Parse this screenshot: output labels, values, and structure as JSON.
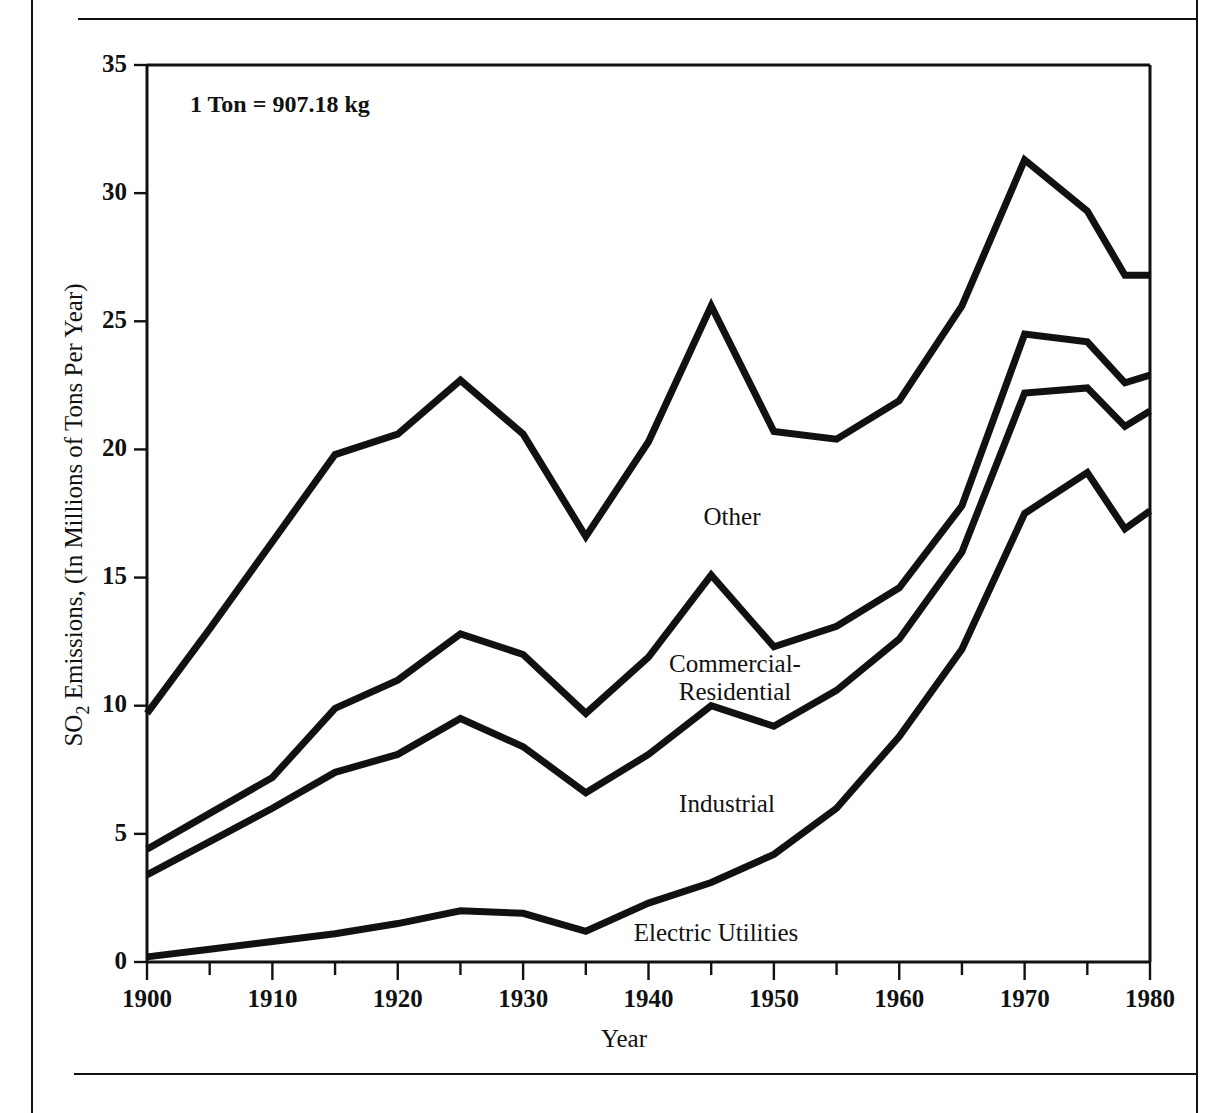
{
  "page": {
    "cut_off_header_text": "",
    "figure_note": "1 Ton  =  907.18 kg"
  },
  "axes": {
    "y_title": "SO",
    "y_title_sub": "2",
    "y_title_rest": " Emissions, (In Millions of Tons Per Year)",
    "x_title": "Year",
    "y_ticks": [
      "0",
      "5",
      "10",
      "15",
      "20",
      "25",
      "30",
      "35"
    ],
    "x_ticks": [
      "1900",
      "1910",
      "1920",
      "1930",
      "1940",
      "1950",
      "1960",
      "1970",
      "1980"
    ]
  },
  "series_labels": {
    "other": "Other",
    "commercial_line1": "Commercial-",
    "commercial_line2": "Residential",
    "industrial": "Industrial",
    "electric": "Electric Utilities"
  },
  "chart_data": {
    "type": "area",
    "title": "",
    "subtitle": "",
    "xlabel": "Year",
    "ylabel": "SO2 Emissions, (In Millions of Tons Per Year)",
    "xlim": [
      1900,
      1980
    ],
    "ylim": [
      0,
      35
    ],
    "grid": false,
    "legend_position": "inline-annotations",
    "annotations": [
      "1 Ton  =  907.18 kg"
    ],
    "stacked": true,
    "note": "Lines are cumulative totals of a stacked area; component values = difference between adjacent cumulative lines.",
    "x": [
      1900,
      1905,
      1910,
      1915,
      1920,
      1925,
      1930,
      1935,
      1940,
      1945,
      1950,
      1955,
      1960,
      1965,
      1970,
      1975,
      1978,
      1980
    ],
    "cumulative_series": [
      {
        "name": "Total (Other + Commercial-Residential + Industrial + Electric Utilities)",
        "values": [
          9.7,
          13.0,
          16.4,
          19.8,
          20.6,
          22.7,
          20.6,
          16.6,
          20.3,
          25.6,
          20.7,
          20.4,
          21.9,
          25.6,
          31.3,
          29.3,
          26.8,
          26.8
        ]
      },
      {
        "name": "Commercial-Residential + Industrial + Electric Utilities",
        "values": [
          4.4,
          5.8,
          7.2,
          9.9,
          11.0,
          12.8,
          12.0,
          9.7,
          11.9,
          15.1,
          12.3,
          13.1,
          14.6,
          17.8,
          24.5,
          24.2,
          22.6,
          22.9
        ]
      },
      {
        "name": "Industrial + Electric Utilities",
        "values": [
          3.4,
          4.7,
          6.0,
          7.4,
          8.1,
          9.5,
          8.4,
          6.6,
          8.1,
          10.0,
          9.2,
          10.6,
          12.6,
          16.0,
          22.2,
          22.4,
          20.9,
          21.5
        ]
      },
      {
        "name": "Electric Utilities",
        "values": [
          0.2,
          0.5,
          0.8,
          1.1,
          1.5,
          2.0,
          1.9,
          1.2,
          2.3,
          3.1,
          4.2,
          6.0,
          8.8,
          12.2,
          17.5,
          19.1,
          16.9,
          17.6
        ]
      }
    ],
    "component_series": [
      {
        "name": "Other",
        "values": [
          5.3,
          7.2,
          9.2,
          9.9,
          9.6,
          9.9,
          8.6,
          6.9,
          8.4,
          10.5,
          8.4,
          7.3,
          7.3,
          7.8,
          6.8,
          5.1,
          4.2,
          3.9
        ]
      },
      {
        "name": "Commercial-Residential",
        "values": [
          1.0,
          1.1,
          1.2,
          2.5,
          2.9,
          3.3,
          3.6,
          3.1,
          3.8,
          5.1,
          3.1,
          2.5,
          2.0,
          1.8,
          2.3,
          1.8,
          1.7,
          1.4
        ]
      },
      {
        "name": "Industrial",
        "values": [
          3.2,
          4.2,
          5.2,
          6.3,
          6.6,
          7.5,
          6.5,
          5.4,
          5.8,
          6.9,
          5.0,
          4.6,
          3.8,
          3.8,
          4.7,
          3.3,
          4.0,
          3.9
        ]
      },
      {
        "name": "Electric Utilities",
        "values": [
          0.2,
          0.5,
          0.8,
          1.1,
          1.5,
          2.0,
          1.9,
          1.2,
          2.3,
          3.1,
          4.2,
          6.0,
          8.8,
          12.2,
          17.5,
          19.1,
          16.9,
          17.6
        ]
      }
    ]
  }
}
